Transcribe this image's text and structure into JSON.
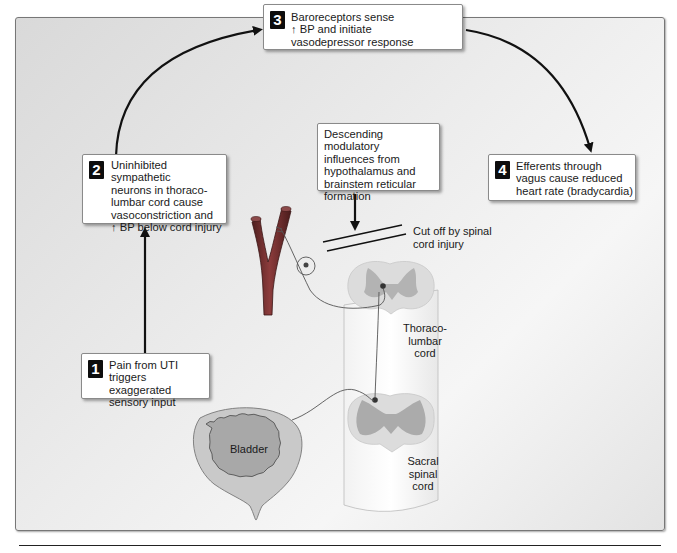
{
  "steps": [
    {
      "number": "1",
      "text": "Pain from UTI\ntriggers exaggerated\nsensory input"
    },
    {
      "number": "2",
      "text": "Uninhibited sympathetic\nneurons in thoraco-\nlumbar cord cause\nvasoconstriction and\n↑ BP below cord injury"
    },
    {
      "number": "3",
      "text": "Baroreceptors sense\n↑ BP and initiate\nvasodepressor response"
    },
    {
      "number": "4",
      "text": "Efferents through\nvagus cause reduced\nheart rate (bradycardia)"
    }
  ],
  "descending_box": {
    "text": "Descending modulatory\ninfluences from\nhypothalamus and\nbrainstem reticular\nformation"
  },
  "labels": {
    "cut_off": "Cut off by spinal\ncord injury",
    "thoracolumbar": "Thoraco-\nlumbar\ncord",
    "sacral": "Sacral\nspinal\ncord",
    "bladder": "Bladder"
  },
  "colors": {
    "vessel": "#6b2a2a",
    "vessel_highlight": "#a85050",
    "gray_matter": "#b8b8b8",
    "white_matter": "#dedede",
    "bladder_wall": "#c8c8c8",
    "bladder_lumen": "#a9a9a9"
  }
}
